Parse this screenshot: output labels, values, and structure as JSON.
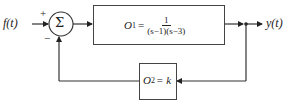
{
  "diagram": {
    "type": "block-diagram",
    "input": {
      "label": "f(t)"
    },
    "output": {
      "label": "y(t)"
    },
    "summing_junction": {
      "symbol": "Σ",
      "plus_sign": "+",
      "minus_sign": "−"
    },
    "forward_block": {
      "name": "O",
      "subscript": "1",
      "equals": "=",
      "numerator": "1",
      "denominator": "(s−1)(s−3)"
    },
    "feedback_block": {
      "name": "O",
      "subscript": "2",
      "equals": "= k"
    }
  }
}
